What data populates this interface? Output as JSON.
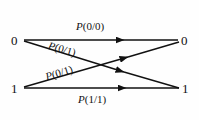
{
  "figure": {
    "background_color": "#fefefe",
    "line_color": "#111111"
  },
  "nodes": {
    "input": [
      {
        "id": "in-0",
        "label": "0"
      },
      {
        "id": "in-1",
        "label": "1"
      }
    ],
    "output": [
      {
        "id": "out-0",
        "label": "0"
      },
      {
        "id": "out-1",
        "label": "1"
      }
    ]
  },
  "edges": [
    {
      "id": "p00",
      "from": "in-0",
      "to": "out-0",
      "label_prefix": "P",
      "label_body": "(0/0)",
      "label": "P(0/0)",
      "style": "horizontal-top"
    },
    {
      "id": "p01-upper",
      "from": "in-0",
      "to": "out-1",
      "label_prefix": "P",
      "label_body": "(0/1)",
      "label": "P(0/1)",
      "style": "diagonal-down"
    },
    {
      "id": "p01-lower",
      "from": "in-1",
      "to": "out-0",
      "label_prefix": "P",
      "label_body": "(0/1)",
      "label": "P(0/1)",
      "style": "diagonal-up"
    },
    {
      "id": "p11",
      "from": "in-1",
      "to": "out-1",
      "label_prefix": "P",
      "label_body": "(1/1)",
      "label": "P(1/1)",
      "style": "horizontal-bottom"
    }
  ]
}
